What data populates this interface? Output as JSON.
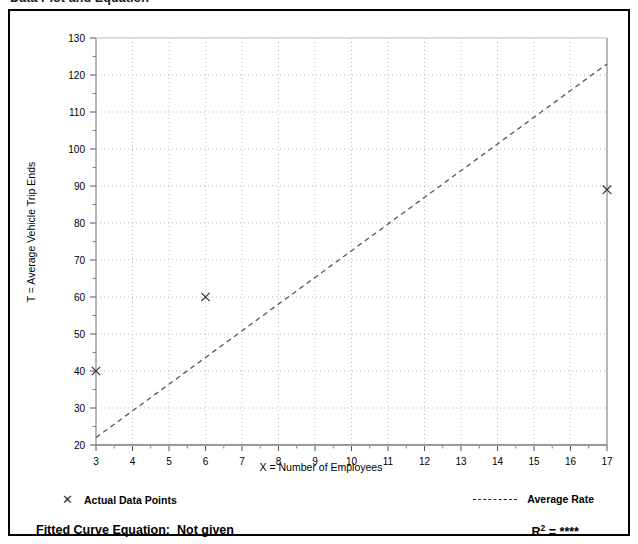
{
  "page": {
    "title": "Data Plot and Equation"
  },
  "legend": {
    "data_points_marker": "✕",
    "data_points_label": "Actual Data Points",
    "average_rate_label": "Average Rate"
  },
  "equation": {
    "label": "Fitted Curve Equation:",
    "value": "Not given",
    "r_symbol": "R",
    "r_exponent": "2",
    "r_equals": " = ",
    "r_value": "****"
  },
  "chart_data": {
    "type": "scatter",
    "title": "",
    "xlabel": "X = Number of Employees",
    "ylabel": "T = Average Vehicle Trip Ends",
    "xlim": [
      3,
      17
    ],
    "ylim": [
      20,
      130
    ],
    "xticks": [
      3,
      4,
      5,
      6,
      7,
      8,
      9,
      10,
      11,
      12,
      13,
      14,
      15,
      16,
      17
    ],
    "yticks": [
      20,
      30,
      40,
      50,
      60,
      70,
      80,
      90,
      100,
      110,
      120,
      130
    ],
    "xtick_labels": [
      "3",
      "4",
      "5",
      "6",
      "7",
      "8",
      "9",
      "10",
      "11",
      "12",
      "13",
      "14",
      "15",
      "16",
      "17"
    ],
    "ytick_labels": [
      "20",
      "30",
      "40",
      "50",
      "60",
      "70",
      "80",
      "90",
      "100",
      "110",
      "120",
      "130"
    ],
    "grid": true,
    "minor_ticks": true,
    "legend_position": "below-plot",
    "series": [
      {
        "name": "Actual Data Points",
        "type": "scatter",
        "marker": "x",
        "color": "#333333",
        "points": [
          {
            "x": 3,
            "y": 40
          },
          {
            "x": 6,
            "y": 60
          },
          {
            "x": 17,
            "y": 89
          }
        ]
      },
      {
        "name": "Average Rate",
        "type": "line",
        "style": "dashed",
        "color": "#555555",
        "points": [
          {
            "x": 3,
            "y": 22
          },
          {
            "x": 17,
            "y": 123
          }
        ]
      }
    ]
  }
}
